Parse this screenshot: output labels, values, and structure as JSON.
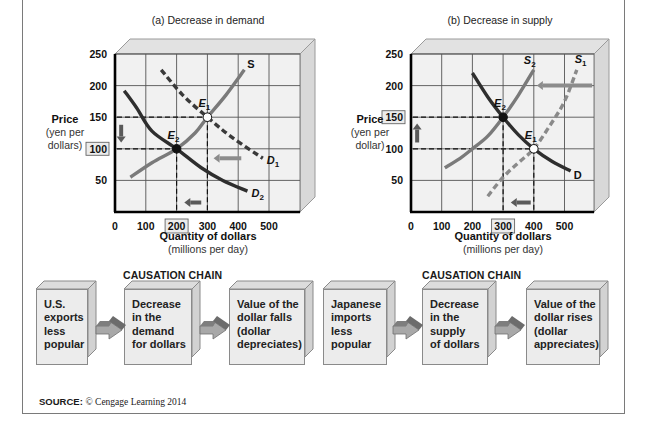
{
  "source": {
    "label": "SOURCE:",
    "text": "© Cengage Learning 2014"
  },
  "chart_data": [
    {
      "type": "line",
      "title": "(a) Decrease in demand",
      "xlabel": "Quantity of dollars",
      "xlabel_sub": "(millions per day)",
      "ylabel": "Price",
      "ylabel_sub": [
        "(yen per",
        "dollars)"
      ],
      "xlim": [
        0,
        600
      ],
      "ylim": [
        0,
        250
      ],
      "x_ticks": [
        "0",
        "100",
        "200",
        "300",
        "400",
        "500"
      ],
      "x_tick_values": [
        0,
        100,
        200,
        300,
        400,
        500
      ],
      "y_ticks": [
        "50",
        "100",
        "150",
        "200",
        "250"
      ],
      "y_tick_values": [
        50,
        100,
        150,
        200,
        250
      ],
      "highlighted_x_tick": "200",
      "highlighted_y_tick": "100",
      "grid": true,
      "series": [
        {
          "name": "S",
          "style": "solid",
          "color": "#7a7a7a",
          "points": [
            [
              50,
              55
            ],
            [
              120,
              78
            ],
            [
              200,
              100
            ],
            [
              260,
              125
            ],
            [
              300,
              150
            ],
            [
              360,
              185
            ],
            [
              420,
              225
            ]
          ]
        },
        {
          "name": "D1",
          "label_sub": "1",
          "style": "dashed",
          "color": "#3a3a3a",
          "points": [
            [
              150,
              225
            ],
            [
              220,
              185
            ],
            [
              300,
              150
            ],
            [
              380,
              118
            ],
            [
              480,
              85
            ]
          ]
        },
        {
          "name": "D2",
          "label_sub": "2",
          "style": "solid",
          "color": "#2e2e2e",
          "points": [
            [
              30,
              192
            ],
            [
              70,
              165
            ],
            [
              120,
              128
            ],
            [
              200,
              100
            ],
            [
              280,
              70
            ],
            [
              350,
              50
            ],
            [
              430,
              33
            ]
          ]
        }
      ],
      "points": [
        {
          "name": "E1",
          "label_sub": "1",
          "x": 300,
          "y": 150,
          "fill": "#ffffff"
        },
        {
          "name": "E2",
          "label_sub": "2",
          "x": 200,
          "y": 100,
          "fill": "#111111"
        }
      ],
      "guides": {
        "x": [
          200,
          300
        ],
        "y": [
          100,
          150
        ]
      },
      "shift_arrows": [
        {
          "direction": "down",
          "from": [
            20,
            138
          ],
          "to": [
            20,
            110
          ]
        },
        {
          "direction": "left",
          "from": [
            410,
            85
          ],
          "to": [
            320,
            85
          ]
        },
        {
          "direction": "left",
          "from": [
            280,
            15
          ],
          "to": [
            225,
            15
          ]
        }
      ]
    },
    {
      "type": "line",
      "title": "(b) Decrease in supply",
      "xlabel": "Quantity of dollars",
      "xlabel_sub": "(millions per day)",
      "ylabel": "Price",
      "ylabel_sub": [
        "(yen per",
        "dollar)"
      ],
      "xlim": [
        0,
        600
      ],
      "ylim": [
        0,
        250
      ],
      "x_ticks": [
        "0",
        "100",
        "200",
        "300",
        "400",
        "500"
      ],
      "x_tick_values": [
        0,
        100,
        200,
        300,
        400,
        500
      ],
      "y_ticks": [
        "50",
        "100",
        "150",
        "200",
        "250"
      ],
      "y_tick_values": [
        50,
        100,
        150,
        200,
        250
      ],
      "highlighted_x_tick": "300",
      "highlighted_y_tick": "150",
      "grid": true,
      "series": [
        {
          "name": "S2",
          "label_sub": "2",
          "style": "solid",
          "color": "#7a7a7a",
          "points": [
            [
              110,
              70
            ],
            [
              160,
              85
            ],
            [
              200,
              100
            ],
            [
              250,
              120
            ],
            [
              300,
              150
            ],
            [
              350,
              185
            ],
            [
              400,
              225
            ]
          ]
        },
        {
          "name": "S1",
          "label_sub": "1",
          "style": "dashed",
          "color": "#8a8a8a",
          "points": [
            [
              250,
              25
            ],
            [
              300,
              55
            ],
            [
              350,
              78
            ],
            [
              400,
              100
            ],
            [
              450,
              135
            ],
            [
              500,
              175
            ],
            [
              540,
              225
            ]
          ]
        },
        {
          "name": "D",
          "style": "solid",
          "color": "#2e2e2e",
          "points": [
            [
              200,
              220
            ],
            [
              250,
              182
            ],
            [
              300,
              150
            ],
            [
              350,
              122
            ],
            [
              400,
              100
            ],
            [
              460,
              80
            ],
            [
              520,
              65
            ]
          ]
        }
      ],
      "points": [
        {
          "name": "E2",
          "label_sub": "2",
          "x": 300,
          "y": 150,
          "fill": "#111111"
        },
        {
          "name": "E1",
          "label_sub": "1",
          "x": 400,
          "y": 100,
          "fill": "#ffffff"
        }
      ],
      "guides": {
        "x": [
          300,
          400
        ],
        "y": [
          100,
          150
        ]
      },
      "shift_arrows": [
        {
          "direction": "up",
          "from": [
            20,
            110
          ],
          "to": [
            20,
            140
          ]
        },
        {
          "direction": "left",
          "from": [
            590,
            200
          ],
          "to": [
            410,
            200
          ]
        },
        {
          "direction": "left",
          "from": [
            390,
            15
          ],
          "to": [
            325,
            15
          ]
        }
      ]
    }
  ],
  "causation_chains": [
    {
      "title": "CAUSATION CHAIN",
      "steps": [
        [
          "U.S.",
          "exports",
          "less",
          "popular"
        ],
        [
          "Decrease",
          "in the",
          "demand",
          "for dollars"
        ],
        [
          "Value of the",
          "dollar falls",
          "(dollar",
          "depreciates)"
        ]
      ]
    },
    {
      "title": "CAUSATION CHAIN",
      "steps": [
        [
          "Japanese",
          "imports",
          "less",
          "popular"
        ],
        [
          "Decrease",
          "in the",
          "supply",
          "of dollars"
        ],
        [
          "Value of the",
          "dollar rises",
          "(dollar",
          "appreciates)"
        ]
      ]
    }
  ]
}
